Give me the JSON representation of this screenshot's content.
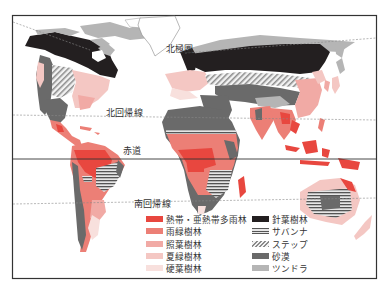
{
  "lines": {
    "arctic_circle": "北極圏",
    "tropic_of_cancer": "北回帰線",
    "equator": "赤道",
    "tropic_of_capricorn": "南回帰線"
  },
  "colors": {
    "tropical_rainforest": "#e8473f",
    "rain_green_forest": "#ec7f76",
    "laurel_forest": "#f1aaa5",
    "deciduous_forest": "#f4c7c3",
    "sclerophyll_forest": "#f8e0dd",
    "coniferous_forest": "#231f20",
    "savanna": "#555555",
    "steppe": "#9a9a9a",
    "desert": "#6a6a6a",
    "tundra": "#b5b5b5",
    "frame": "#333333",
    "lat_line": "#888888"
  },
  "legend": {
    "left": [
      {
        "label": "熱帯・亜熱帯多雨林",
        "key": "tropical_rainforest"
      },
      {
        "label": "雨緑樹林",
        "key": "rain_green_forest"
      },
      {
        "label": "照葉樹林",
        "key": "laurel_forest"
      },
      {
        "label": "夏緑樹林",
        "key": "deciduous_forest"
      },
      {
        "label": "硬葉樹林",
        "key": "sclerophyll_forest"
      }
    ],
    "right": [
      {
        "label": "針葉樹林",
        "key": "coniferous_forest"
      },
      {
        "label": "サバンナ",
        "key": "savanna"
      },
      {
        "label": "ステップ",
        "key": "steppe"
      },
      {
        "label": "砂漠",
        "key": "desert"
      },
      {
        "label": "ツンドラ",
        "key": "tundra"
      }
    ]
  }
}
